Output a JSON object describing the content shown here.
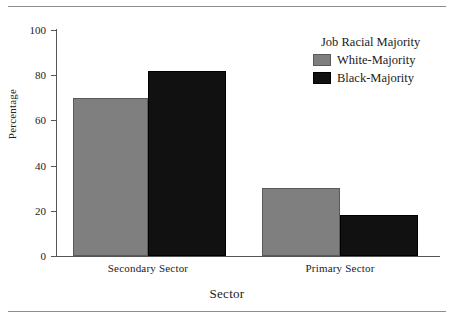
{
  "chart_data": {
    "type": "bar",
    "title": "",
    "subtitle": "",
    "xlabel": "Sector",
    "ylabel": "Percentage",
    "categories": [
      "Secondary Sector",
      "Primary Sector"
    ],
    "series": [
      {
        "name": "White-Majority",
        "values": [
          70,
          30
        ],
        "color": "#7f7f7f"
      },
      {
        "name": "Black-Majority",
        "values": [
          82,
          18
        ],
        "color": "#111111"
      }
    ],
    "ylim": [
      0,
      100
    ],
    "yticks": [
      0,
      20,
      40,
      60,
      80,
      100
    ],
    "ytick_labels": [
      "0",
      "20",
      "40",
      "60",
      "80",
      "100"
    ],
    "grid": false,
    "legend": {
      "title": "Job Racial Majority",
      "position": "top-right",
      "entries": [
        {
          "label": "White-Majority",
          "color": "#7f7f7f"
        },
        {
          "label": "Black-Majority",
          "color": "#111111"
        }
      ]
    },
    "annotations": [],
    "frame": {
      "top_rule": true,
      "bottom_rule": true,
      "rule_color": "#8d8d8d"
    }
  }
}
